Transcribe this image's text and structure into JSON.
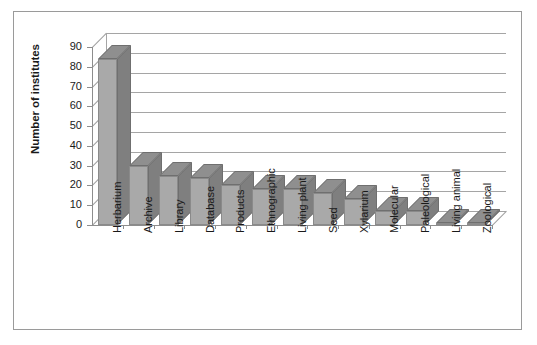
{
  "chart_data": {
    "type": "bar",
    "title": "",
    "xlabel": "",
    "ylabel": "Number of institutes",
    "ylim": [
      0,
      90
    ],
    "ytick_step": 10,
    "yticks": [
      90,
      80,
      70,
      60,
      50,
      40,
      30,
      20,
      10,
      0
    ],
    "grid": true,
    "legend": "none",
    "style": "3d-column",
    "categories": [
      "Herbarium",
      "Archive",
      "Library",
      "Database",
      "Products",
      "Ethnographic",
      "Living plant",
      "Seed",
      "Xylarium",
      "Molecular",
      "Paleological",
      "Living animal",
      "Zoological"
    ],
    "values": [
      84,
      30,
      25,
      24,
      20,
      18,
      18,
      16,
      13,
      7,
      7,
      1,
      1
    ]
  },
  "colors": {
    "bar_face": "#a9a9a9",
    "bar_side": "#7f7f7f",
    "bar_top": "#8f8f8f",
    "gridline": "#a5a5a5",
    "axis": "#8d8d8d",
    "frame": "#9a9a9a",
    "text": "#1a1a1a",
    "background": "#ffffff"
  }
}
